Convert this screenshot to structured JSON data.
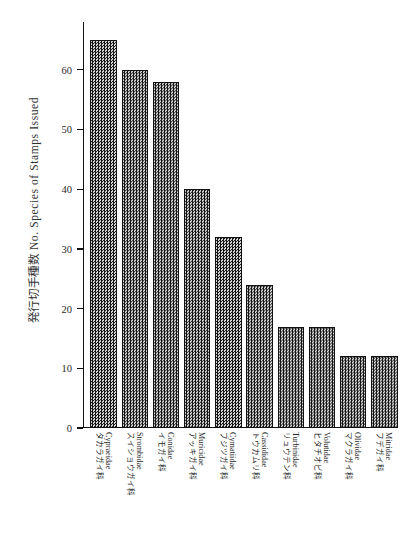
{
  "chart_data": {
    "type": "bar",
    "title": "",
    "subtitle": "",
    "xlabel": "",
    "ylabel": "発行切手種数 No. Species of Stamps Issued",
    "ylim": [
      0,
      68
    ],
    "yticks": [
      0,
      10,
      20,
      30,
      40,
      50,
      60
    ],
    "ytick_labels": [
      "0",
      "10",
      "20",
      "30",
      "40",
      "50",
      "60"
    ],
    "grid": false,
    "legend": "none",
    "bar_fill": "checkerboard-hatch",
    "bar_border_color": "#111111",
    "categories": [
      "Cypraeidae タカラガイ科",
      "Strombidae スイショウガイ科",
      "Conidae イモガイ科",
      "Muricidae アッキガイ科",
      "Cymatiidae フジツガイ科",
      "Cassididae トウカムリ科",
      "Turbinidae リュウテン科",
      "Volutidae ヒタチオビ科",
      "Olividae マクラガイ科",
      "Mitridae フデガイ科"
    ],
    "category_parts": [
      {
        "sci": "Cypraeidae",
        "jp": "タカラガイ科"
      },
      {
        "sci": "Strombidae",
        "jp": "スイショウガイ科"
      },
      {
        "sci": "Conidae",
        "jp": "イモガイ科"
      },
      {
        "sci": "Muricidae",
        "jp": "アッキガイ科"
      },
      {
        "sci": "Cymatiidae",
        "jp": "フジツガイ科"
      },
      {
        "sci": "Cassididae",
        "jp": "トウカムリ科"
      },
      {
        "sci": "Turbinidae",
        "jp": "リュウテン科"
      },
      {
        "sci": "Volutidae",
        "jp": "ヒタチオビ科"
      },
      {
        "sci": "Olividae",
        "jp": "マクラガイ科"
      },
      {
        "sci": "Mitridae",
        "jp": "フデガイ科"
      }
    ],
    "values": [
      65,
      60,
      58,
      40,
      32,
      24,
      17,
      17,
      12,
      12
    ]
  },
  "footer": {
    "mark": ""
  }
}
